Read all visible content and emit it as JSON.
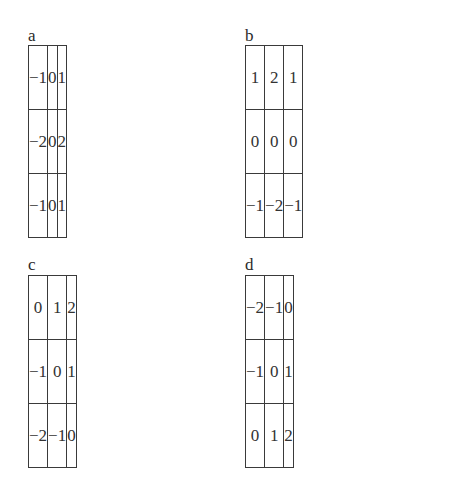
{
  "panels": [
    {
      "label": "a",
      "matrix": [
        [
          "−1",
          "0",
          "1"
        ],
        [
          "−2",
          "0",
          "2"
        ],
        [
          "−1",
          "0",
          "1"
        ]
      ]
    },
    {
      "label": "b",
      "matrix": [
        [
          "1",
          "2",
          "1"
        ],
        [
          "0",
          "0",
          "0"
        ],
        [
          "−1",
          "−2",
          "−1"
        ]
      ]
    },
    {
      "label": "c",
      "matrix": [
        [
          "0",
          "1",
          "2"
        ],
        [
          "−1",
          "0",
          "1"
        ],
        [
          "−2",
          "−1",
          "0"
        ]
      ]
    },
    {
      "label": "d",
      "matrix": [
        [
          "−2",
          "−1",
          "0"
        ],
        [
          "−1",
          "0",
          "1"
        ],
        [
          "0",
          "1",
          "2"
        ]
      ]
    }
  ]
}
